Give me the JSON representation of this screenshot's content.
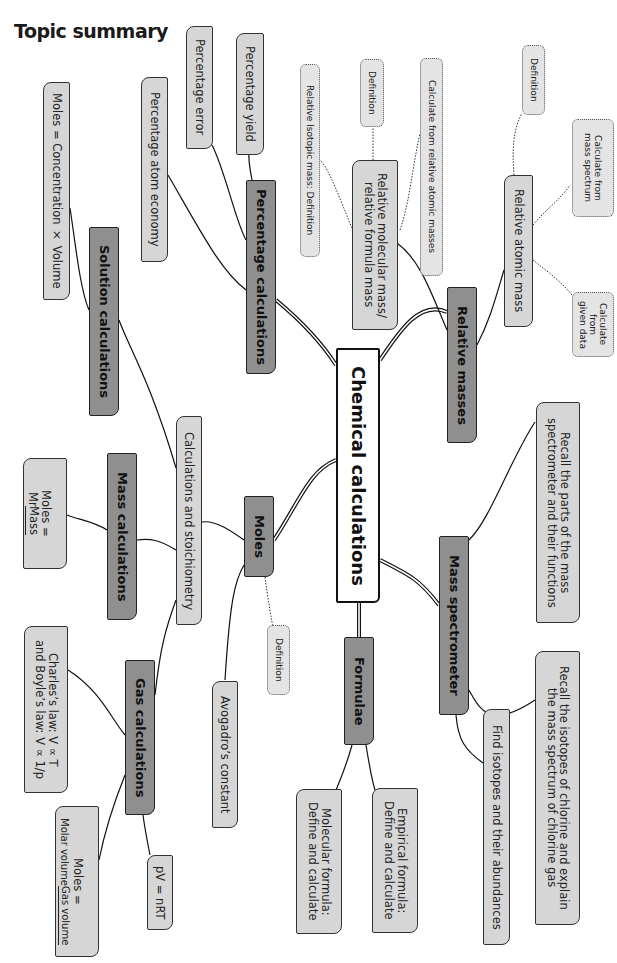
{
  "page": {
    "title": "Topic summary"
  },
  "mindmap": {
    "center": "Chemical calculations",
    "branches": {
      "relative_masses": {
        "label": "Relative masses",
        "children": {
          "relative_atomic_mass": {
            "label": "Relative atomic mass",
            "children": [
              "Definition",
              "Calculate from\nmass spectrum",
              "Calculate from\ngiven data"
            ]
          },
          "relative_molecular_mass": {
            "label": "Relative molecular mass/\nrelative formula mass",
            "children": [
              "Relative Isotopic mass: Definition",
              "Definition",
              "Calculate from relative atomic masses"
            ]
          }
        }
      },
      "percentage_calculations": {
        "label": "Percentage calculations",
        "children": [
          "Percentage yield",
          "Percentage error",
          "Percentage atom economy"
        ]
      },
      "moles": {
        "label": "Moles",
        "children": {
          "calc_stoich": "Calculations and stoichiometry",
          "definition": "Definition",
          "avogadro": "Avogadro’s constant"
        }
      },
      "solution_calculations": {
        "label": "Solution calculations",
        "children": [
          "Moles = Concentration × Volume"
        ]
      },
      "mass_calculations": {
        "label": "Mass calculations",
        "formula": {
          "lhs": "Moles =",
          "numerator": "Mass",
          "denominator": "Mr"
        }
      },
      "gas_calculations": {
        "label": "Gas calculations",
        "children": {
          "laws": "Charles’s law: V ∝ T\nand Boyle’s law: V ∝ 1/p",
          "ideal_gas": "pV = nRT",
          "molar_volume": {
            "lhs": "Moles =",
            "numerator": "Gas volume",
            "denominator": "Molar volume"
          }
        }
      },
      "formulae": {
        "label": "Formulae",
        "children": [
          "Empirical formula:\nDefine and calculate",
          "Molecular formula:\nDefine and calculate"
        ]
      },
      "mass_spectrometer": {
        "label": "Mass spectrometer",
        "children": [
          "Recall the parts of the mass\nspectrometer and their functions",
          "Recall the isotopes of chlorine and explain\nthe mass spectrum of  chlorine gas",
          "Find isotopes and their abundances"
        ]
      }
    }
  },
  "colors": {
    "center_fill": "#ffffff",
    "main_fill": "#8f8f8f",
    "sub_fill": "#d6d6d6",
    "dotted_fill": "#e4e4e4",
    "line": "#111111"
  }
}
